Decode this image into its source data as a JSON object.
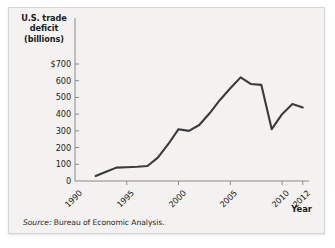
{
  "figure": {
    "background_color": "#f3f2f0",
    "border_color": "#d8d6d2"
  },
  "axes": {
    "y_title_lines": [
      "U.S. trade",
      "deficit",
      "(billions)"
    ],
    "x_title": "Year"
  },
  "source": {
    "label": "Source:",
    "text": " Bureau of Economic Analysis."
  },
  "chart_data": {
    "type": "line",
    "title": "",
    "xlabel": "Year",
    "ylabel": "U.S. trade deficit (billions)",
    "line_color": "#3b3b3b",
    "grid": false,
    "legend": "none",
    "xlim": [
      1990,
      2012.6
    ],
    "ylim": [
      0,
      760
    ],
    "ytick_values": [
      0,
      100,
      200,
      300,
      400,
      500,
      600,
      700
    ],
    "ytick_labels": [
      "0",
      "100",
      "200",
      "300",
      "400",
      "500",
      "600",
      "$700"
    ],
    "xtick_values": [
      1990,
      1995,
      2000,
      2005,
      2010,
      2012
    ],
    "xtick_labels": [
      "1990",
      "1995",
      "2000",
      "2005",
      "2010",
      "2012"
    ],
    "x": [
      1992,
      1993,
      1994,
      1995,
      1996,
      1997,
      1998,
      1999,
      2000,
      2001,
      2002,
      2003,
      2004,
      2005,
      2006,
      2007,
      2008,
      2009,
      2010,
      2011,
      2012
    ],
    "values": [
      30,
      55,
      80,
      82,
      85,
      90,
      140,
      220,
      310,
      300,
      335,
      405,
      485,
      555,
      620,
      580,
      575,
      310,
      400,
      460,
      440
    ],
    "series": [
      {
        "name": "U.S. trade deficit (billions)",
        "values": [
          30,
          55,
          80,
          82,
          85,
          90,
          140,
          220,
          310,
          300,
          335,
          405,
          485,
          555,
          620,
          580,
          575,
          310,
          400,
          460,
          440
        ]
      }
    ]
  }
}
